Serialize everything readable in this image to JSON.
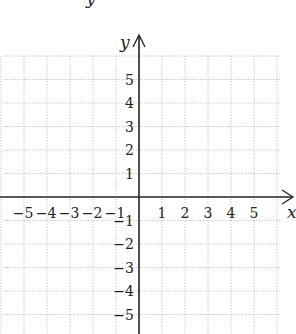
{
  "diagram": {
    "type": "coordinate-plane",
    "top_cropped_label": "y",
    "axes": {
      "x_label": "x",
      "y_label": "y",
      "x_range": [
        -5,
        5
      ],
      "y_range": [
        -5,
        5
      ]
    },
    "x_ticks": [
      {
        "value": -5,
        "label": "−5"
      },
      {
        "value": -4,
        "label": "−4"
      },
      {
        "value": -3,
        "label": "−3"
      },
      {
        "value": -2,
        "label": "−2"
      },
      {
        "value": -1,
        "label": "−1"
      },
      {
        "value": 1,
        "label": "1"
      },
      {
        "value": 2,
        "label": "2"
      },
      {
        "value": 3,
        "label": "3"
      },
      {
        "value": 4,
        "label": "4"
      },
      {
        "value": 5,
        "label": "5"
      }
    ],
    "y_ticks": [
      {
        "value": 5,
        "label": "5"
      },
      {
        "value": 4,
        "label": "4"
      },
      {
        "value": 3,
        "label": "3"
      },
      {
        "value": 2,
        "label": "2"
      },
      {
        "value": 1,
        "label": "1"
      },
      {
        "value": -1,
        "label": "−1"
      },
      {
        "value": -2,
        "label": "−2"
      },
      {
        "value": -3,
        "label": "−3"
      },
      {
        "value": -4,
        "label": "−4"
      },
      {
        "value": -5,
        "label": "−5"
      }
    ],
    "colors": {
      "axis": "#222222",
      "grid": "#b0b0b0",
      "background": "#ffffff"
    }
  }
}
